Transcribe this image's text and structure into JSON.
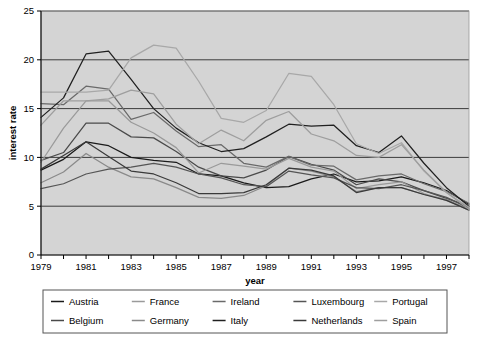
{
  "chart_data": {
    "type": "line",
    "title": "",
    "xlabel": "year",
    "ylabel": "interest rate",
    "xlim": [
      1979,
      1998
    ],
    "ylim": [
      0,
      25
    ],
    "yticks": [
      0,
      5,
      10,
      15,
      20,
      25
    ],
    "xticks": [
      1979,
      1980,
      1981,
      1982,
      1983,
      1984,
      1985,
      1986,
      1987,
      1988,
      1989,
      1990,
      1991,
      1992,
      1993,
      1994,
      1995,
      1996,
      1997,
      1998
    ],
    "xtick_labels": [
      "1979",
      "",
      "1981",
      "",
      "1983",
      "",
      "1985",
      "",
      "1987",
      "",
      "1989",
      "",
      "1991",
      "",
      "1993",
      "",
      "1995",
      "",
      "1997",
      ""
    ],
    "grid": "horizontal",
    "plot_background": "#d4d4d4",
    "legend_position": "bottom",
    "legend_columns": 5,
    "x": [
      1979,
      1980,
      1981,
      1982,
      1983,
      1984,
      1985,
      1986,
      1987,
      1988,
      1989,
      1990,
      1991,
      1992,
      1993,
      1994,
      1995,
      1996,
      1997,
      1998
    ],
    "series": [
      {
        "name": "Austria",
        "color": "#1a1a1a",
        "values": [
          8.7,
          9.8,
          11.6,
          11.2,
          10.0,
          9.7,
          9.5,
          8.3,
          8.1,
          7.4,
          6.9,
          7.0,
          7.8,
          8.3,
          7.5,
          7.6,
          8.0,
          7.4,
          6.6,
          5.2
        ]
      },
      {
        "name": "Belgium",
        "color": "#4a4a4a",
        "values": [
          9.7,
          10.5,
          13.5,
          13.5,
          12.1,
          12.0,
          10.6,
          9.0,
          8.1,
          7.9,
          8.7,
          10.1,
          9.3,
          8.7,
          7.2,
          7.8,
          7.5,
          6.6,
          5.8,
          5.0
        ]
      },
      {
        "name": "France",
        "color": "#9a9a9a",
        "values": [
          9.5,
          13.0,
          15.8,
          15.8,
          13.6,
          12.5,
          11.0,
          8.4,
          9.4,
          9.1,
          8.8,
          9.9,
          9.0,
          8.6,
          6.8,
          7.2,
          7.5,
          6.3,
          5.6,
          4.7
        ]
      },
      {
        "name": "Germany",
        "color": "#8a8a8a",
        "values": [
          7.4,
          8.5,
          10.4,
          9.0,
          8.0,
          7.8,
          6.9,
          5.9,
          5.8,
          6.1,
          7.1,
          8.9,
          8.6,
          8.0,
          6.5,
          6.9,
          6.9,
          6.2,
          5.7,
          4.6
        ]
      },
      {
        "name": "Ireland",
        "color": "#6a6a6a",
        "values": [
          15.5,
          15.4,
          17.3,
          17.0,
          13.9,
          14.6,
          12.7,
          11.1,
          11.3,
          9.4,
          9.0,
          10.1,
          9.2,
          9.1,
          7.7,
          8.1,
          8.3,
          7.3,
          6.5,
          5.3
        ]
      },
      {
        "name": "Italy",
        "color": "#202020",
        "values": [
          14.1,
          16.1,
          20.6,
          20.9,
          18.0,
          15.0,
          13.0,
          11.5,
          10.6,
          10.9,
          12.1,
          13.4,
          13.2,
          13.3,
          11.2,
          10.5,
          12.2,
          9.4,
          6.9,
          5.0
        ]
      },
      {
        "name": "Luxembourg",
        "color": "#555555",
        "values": [
          6.8,
          7.3,
          8.3,
          8.8,
          9.0,
          9.4,
          9.0,
          8.3,
          7.9,
          7.2,
          7.0,
          8.6,
          8.2,
          7.9,
          6.9,
          6.8,
          7.2,
          6.6,
          5.9,
          4.8
        ]
      },
      {
        "name": "Netherlands",
        "color": "#3a3a3a",
        "values": [
          8.8,
          10.2,
          11.6,
          10.1,
          8.6,
          8.3,
          7.4,
          6.3,
          6.3,
          6.4,
          7.2,
          8.9,
          8.7,
          8.1,
          6.4,
          6.9,
          6.9,
          6.2,
          5.6,
          4.6
        ]
      },
      {
        "name": "Portugal",
        "color": "#a8a8a8",
        "values": [
          16.7,
          16.7,
          16.7,
          16.9,
          20.2,
          21.5,
          21.2,
          17.8,
          14.0,
          13.6,
          14.8,
          18.6,
          18.3,
          15.4,
          11.4,
          10.4,
          11.5,
          8.6,
          6.4,
          4.9
        ]
      },
      {
        "name": "Spain",
        "color": "#9e9e9e",
        "values": [
          13.3,
          15.8,
          15.8,
          16.0,
          16.9,
          16.5,
          13.4,
          11.4,
          12.8,
          11.7,
          13.8,
          14.7,
          12.4,
          11.7,
          10.2,
          10.0,
          11.3,
          8.7,
          6.4,
          4.7
        ]
      }
    ]
  },
  "axes": {
    "y_title": "interest rate",
    "x_title": "year"
  },
  "legend": {
    "rows": [
      [
        {
          "label": "Austria",
          "color": "#1a1a1a"
        },
        {
          "label": "France",
          "color": "#9a9a9a"
        },
        {
          "label": "Ireland",
          "color": "#6a6a6a"
        },
        {
          "label": "Luxembourg",
          "color": "#555555"
        },
        {
          "label": "Portugal",
          "color": "#a8a8a8"
        }
      ],
      [
        {
          "label": "Belgium",
          "color": "#4a4a4a"
        },
        {
          "label": "Germany",
          "color": "#8a8a8a"
        },
        {
          "label": "Italy",
          "color": "#202020"
        },
        {
          "label": "Netherlands",
          "color": "#3a3a3a"
        },
        {
          "label": "Spain",
          "color": "#9e9e9e"
        }
      ]
    ]
  },
  "caption": {
    "text": ""
  }
}
